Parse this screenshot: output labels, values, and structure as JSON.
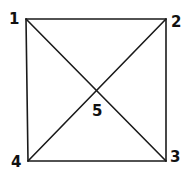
{
  "diagram": {
    "type": "graph",
    "nodes": [
      {
        "id": "1",
        "label": "1",
        "x": 26,
        "y": 19
      },
      {
        "id": "2",
        "label": "2",
        "x": 166,
        "y": 19
      },
      {
        "id": "3",
        "label": "3",
        "x": 166,
        "y": 161
      },
      {
        "id": "4",
        "label": "4",
        "x": 28,
        "y": 161
      },
      {
        "id": "5",
        "label": "5",
        "x": 97,
        "y": 91
      }
    ],
    "edges": [
      [
        "1",
        "2"
      ],
      [
        "2",
        "3"
      ],
      [
        "3",
        "4"
      ],
      [
        "4",
        "1"
      ],
      [
        "1",
        "5"
      ],
      [
        "5",
        "3"
      ],
      [
        "2",
        "5"
      ],
      [
        "5",
        "4"
      ]
    ],
    "colors": {
      "line": "#1a1a1a",
      "background": "#ffffff"
    }
  }
}
